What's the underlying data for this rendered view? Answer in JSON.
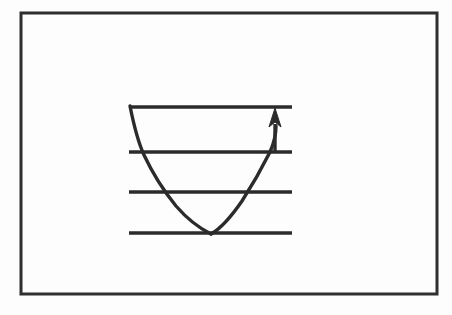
{
  "figure": {
    "kind": "energy-level-potential-well-diagram",
    "caption": "",
    "background_color": "#fdfdfd",
    "ink_color": "#2b2b2b",
    "border": {
      "label": "figure frame",
      "x": 21,
      "y": 13,
      "width": 416,
      "height": 281,
      "stroke_width": 3,
      "color": "#2f2f2f"
    },
    "energy_levels": [
      {
        "name": "level-4",
        "index": 4,
        "x1": 129,
        "x2": 292,
        "y": 107
      },
      {
        "name": "level-3",
        "index": 3,
        "x1": 129,
        "x2": 292,
        "y": 152
      },
      {
        "name": "level-2",
        "index": 2,
        "x1": 129,
        "x2": 292,
        "y": 192
      },
      {
        "name": "level-1",
        "index": 1,
        "x1": 129,
        "x2": 292,
        "y": 233
      }
    ],
    "level_stroke_width": 3.4,
    "potential_curve": {
      "name": "potential-well-curve",
      "description": "V-shaped / parabolic potential well",
      "stroke_width": 3.4,
      "left_branch": "M 130 106 C 134 126 138 142 144 155 C 152 172 163 190 176 206 C 189 221 203 230 211 234",
      "right_branch": "M 211 234 C 220 229 231 217 242 201 C 253 184 263 166 270 152 C 274 143 276 133 276 126"
    },
    "transition_arrow": {
      "name": "upward-transition-arrow",
      "direction": "up",
      "shaft_x": 275,
      "shaft_y_bottom": 152,
      "shaft_y_top": 124,
      "head_tip_y": 108,
      "head_half_width": 6,
      "stroke_width": 3.4
    }
  }
}
